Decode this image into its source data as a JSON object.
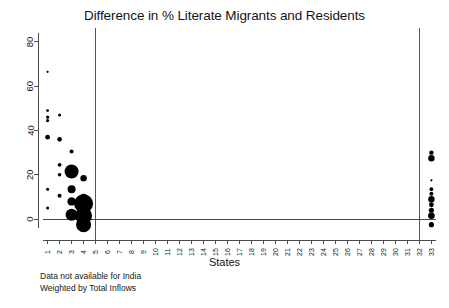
{
  "chart_data": {
    "type": "scatter",
    "title": "Difference in % Literate Migrants and Residents",
    "xlabel": "States",
    "ylabel": "",
    "xlim": [
      0.2,
      33.8
    ],
    "ylim": [
      -4,
      84
    ],
    "grid": false,
    "legend": null,
    "y_ticks": [
      0,
      20,
      40,
      60,
      80
    ],
    "x_ticks": [
      1,
      2,
      3,
      4,
      5,
      6,
      7,
      8,
      9,
      10,
      11,
      12,
      13,
      14,
      15,
      16,
      17,
      18,
      19,
      20,
      21,
      22,
      23,
      24,
      25,
      26,
      27,
      28,
      29,
      30,
      31,
      32,
      33
    ],
    "vertical_reference_lines": [
      5,
      32
    ],
    "size_encoding": "Total Inflows",
    "points": [
      {
        "x": 1,
        "y": 66.5,
        "size": 1.1
      },
      {
        "x": 1,
        "y": 49.0,
        "size": 1.4
      },
      {
        "x": 1,
        "y": 46.0,
        "size": 1.6
      },
      {
        "x": 1,
        "y": 44.5,
        "size": 1.6
      },
      {
        "x": 1,
        "y": 37.0,
        "size": 2.4
      },
      {
        "x": 1,
        "y": 13.5,
        "size": 1.5
      },
      {
        "x": 1,
        "y": 5.0,
        "size": 1.5
      },
      {
        "x": 2,
        "y": 47.0,
        "size": 1.5
      },
      {
        "x": 2,
        "y": 36.0,
        "size": 2.3
      },
      {
        "x": 2,
        "y": 24.5,
        "size": 1.9
      },
      {
        "x": 2,
        "y": 20.0,
        "size": 1.8
      },
      {
        "x": 2,
        "y": 10.5,
        "size": 2.0
      },
      {
        "x": 3,
        "y": 30.5,
        "size": 2.0
      },
      {
        "x": 3,
        "y": 21.5,
        "size": 7.0
      },
      {
        "x": 3,
        "y": 13.5,
        "size": 4.0
      },
      {
        "x": 3,
        "y": 8.0,
        "size": 4.2
      },
      {
        "x": 3,
        "y": 2.0,
        "size": 6.0
      },
      {
        "x": 4,
        "y": 18.5,
        "size": 3.2
      },
      {
        "x": 4,
        "y": 10.0,
        "size": 3.3
      },
      {
        "x": 4,
        "y": 7.0,
        "size": 9.5
      },
      {
        "x": 4,
        "y": 1.5,
        "size": 8.5
      },
      {
        "x": 4,
        "y": -2.5,
        "size": 7.5
      },
      {
        "x": 33,
        "y": 30.0,
        "size": 2.2
      },
      {
        "x": 33,
        "y": 27.5,
        "size": 3.2
      },
      {
        "x": 33,
        "y": 17.5,
        "size": 1.1
      },
      {
        "x": 33,
        "y": 13.5,
        "size": 1.9
      },
      {
        "x": 33,
        "y": 11.5,
        "size": 2.0
      },
      {
        "x": 33,
        "y": 9.0,
        "size": 3.2
      },
      {
        "x": 33,
        "y": 6.5,
        "size": 2.4
      },
      {
        "x": 33,
        "y": 4.0,
        "size": 2.6
      },
      {
        "x": 33,
        "y": 1.5,
        "size": 3.3
      },
      {
        "x": 33,
        "y": -2.5,
        "size": 2.6
      }
    ]
  },
  "footnotes": {
    "line1": "Data not available for India",
    "line2": "Weighted by Total Inflows"
  },
  "colors": {
    "point": "#000000",
    "axis": "#4a4a4a",
    "reference_line": "#555555",
    "background": "#ffffff",
    "text": "#141414"
  }
}
